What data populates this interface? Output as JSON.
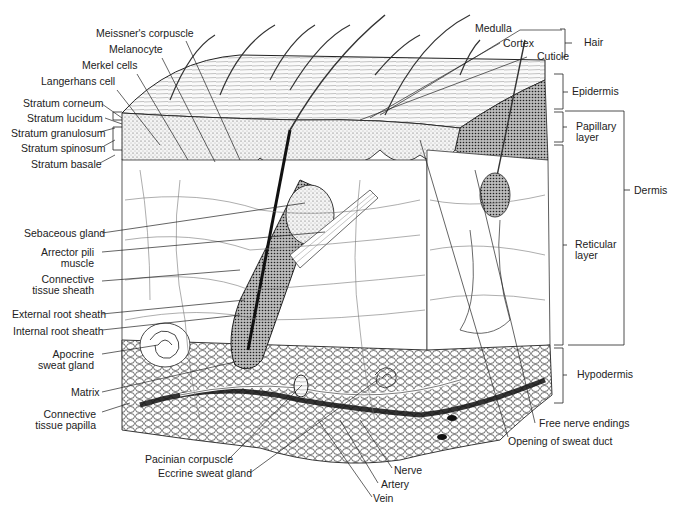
{
  "diagram": {
    "left_labels": {
      "meissners_corpuscle": "Meissner's corpuscle",
      "melanocyte": "Melanocyte",
      "merkel_cells": "Merkel cells",
      "langerhans_cell": "Langerhans cell",
      "stratum_corneum": "Stratum corneum",
      "stratum_lucidum": "Stratum lucidum",
      "stratum_granulosum": "Stratum granulosum",
      "stratum_spinosum": "Stratum spinosum",
      "stratum_basale": "Stratum basale",
      "sebaceous_gland": "Sebaceous gland",
      "arrector_pili_1": "Arrector pili",
      "arrector_pili_2": "muscle",
      "connective_sheath_1": "Connective",
      "connective_sheath_2": "tissue sheath",
      "external_root_sheath": "External root sheath",
      "internal_root_sheath": "Internal root sheath",
      "apocrine_1": "Apocrine",
      "apocrine_2": "sweat gland",
      "matrix": "Matrix",
      "connective_papilla_1": "Connective",
      "connective_papilla_2": "tissue papilla"
    },
    "bottom_labels": {
      "pacinian_corpuscle": "Pacinian corpuscle",
      "eccrine_sweat_gland": "Eccrine sweat gland",
      "nerve": "Nerve",
      "artery": "Artery",
      "vein": "Vein",
      "free_nerve_endings": "Free nerve endings",
      "opening_of_sweat_duct": "Opening of sweat duct"
    },
    "right_labels": {
      "medulla": "Medulla",
      "cortex": "Cortex",
      "cuticle": "Cuticle",
      "hair": "Hair",
      "epidermis": "Epidermis",
      "papillary_1": "Papillary",
      "papillary_2": "layer",
      "dermis": "Dermis",
      "reticular_1": "Reticular",
      "reticular_2": "layer",
      "hypodermis": "Hypodermis"
    }
  }
}
